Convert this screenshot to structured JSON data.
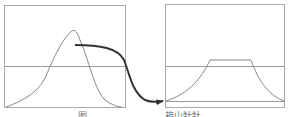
{
  "diagram": {
    "left_panel": {
      "label": "图",
      "curve": "single peak curve crossing a horizontal threshold line",
      "threshold_line": "horizontal reference line"
    },
    "right_panel": {
      "label": "箱山牡牡",
      "curve": "curve with flattened plateau top above threshold line",
      "threshold_line": "horizontal reference line",
      "baseline": "lower horizontal baseline"
    },
    "arrow": {
      "from": "left-panel-peak",
      "to": "right-panel-baseline-left",
      "style": "thick curved arrow"
    },
    "colors": {
      "frame": "#aaaaaa",
      "curve": "#888888",
      "arrow": "#333333"
    }
  }
}
